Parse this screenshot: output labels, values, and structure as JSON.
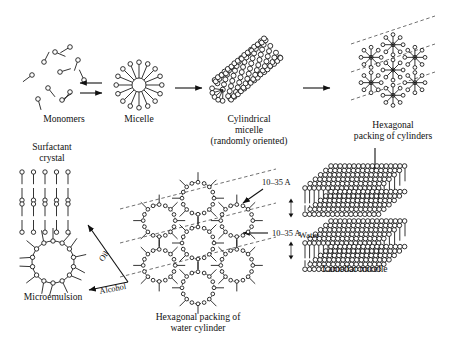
{
  "figure": {
    "background_color": "#ffffff",
    "line_color": "#111111"
  },
  "labels": {
    "monomers": "Monomers",
    "micelle": "Micelle",
    "cylindrical_micelle_l1": "Cylindrical",
    "cylindrical_micelle_l2": "micelle",
    "cylindrical_micelle_l3": "(randomly oriented)",
    "hexagonal_cylinders_l1": "Hexagonal",
    "hexagonal_cylinders_l2": "packing of cylinders",
    "lamellar_micelle": "Lamellar micelle",
    "water": "Water",
    "hexagonal_water_l1": "Hexagonal packing of",
    "hexagonal_water_l2": "water cylinder",
    "microemulsion": "Microemulsion",
    "surfactant_crystal_l1": "Surfactant",
    "surfactant_crystal_l2": "crystal",
    "oil": "Oil",
    "alcohol": "Alcohol",
    "dimension_top": "10–35 A",
    "dimension_bottom": "10–35 A"
  },
  "structures": {
    "monomers": {
      "count": 9
    },
    "micelle": {
      "arms": 16,
      "core_radius": 7
    },
    "cylindrical_micelle": {
      "angle_deg": -40,
      "rows": 7
    },
    "hexagonal_cylinders": {
      "units": 7,
      "spokes": 8
    },
    "hexagonal_water": {
      "units": 7,
      "heads": 16
    },
    "lamellar": {
      "sheets": 3
    },
    "surfactant_crystal": {
      "rows": 4,
      "columns": 5
    },
    "microemulsion": {
      "heads": 14
    }
  },
  "arrows": {
    "equilibrium": "double",
    "monomers_to_micelle": "←→",
    "micelle_to_cylinder": "→",
    "cylinder_to_hexagonal": "→",
    "hexagonal_to_lamellar": "↓",
    "water_to_hexagonal": "←",
    "microemulsion_to_crystal": "↗",
    "crystal_to_microemulsion": "↙"
  }
}
